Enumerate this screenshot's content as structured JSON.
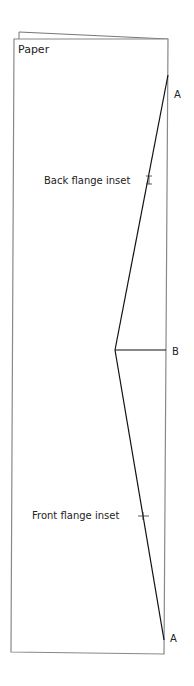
{
  "diagram": {
    "title": "Paper",
    "labels": {
      "top_point": "A",
      "middle_point": "B",
      "bottom_point": "A",
      "back_flange": "Back flange inset",
      "front_flange": "Front flange inset"
    },
    "colors": {
      "background": "#ffffff",
      "paper_outline": "#888888",
      "fold_line": "#111111",
      "text": "#222222"
    }
  }
}
